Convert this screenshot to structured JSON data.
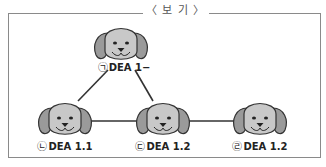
{
  "box": {
    "title": "〈 보 기 〉"
  },
  "nodes": [
    {
      "id": "a",
      "mark": "㉠",
      "text": "DEA 1−",
      "x": 121,
      "y": 45
    },
    {
      "id": "b",
      "mark": "㉡",
      "text": "DEA 1.1",
      "x": 65,
      "y": 120
    },
    {
      "id": "c",
      "mark": "㉢",
      "text": "DEA 1.2",
      "x": 163,
      "y": 120
    },
    {
      "id": "d",
      "mark": "㉣",
      "text": "DEA 1.2",
      "x": 260,
      "y": 120
    }
  ],
  "edges": [
    [
      "a",
      "b"
    ],
    [
      "a",
      "c"
    ],
    [
      "b",
      "c"
    ],
    [
      "c",
      "d"
    ]
  ],
  "colors": {
    "face": "#c8c8c8",
    "ear": "#9a9a9a",
    "stroke": "#333333",
    "line": "#333333"
  }
}
